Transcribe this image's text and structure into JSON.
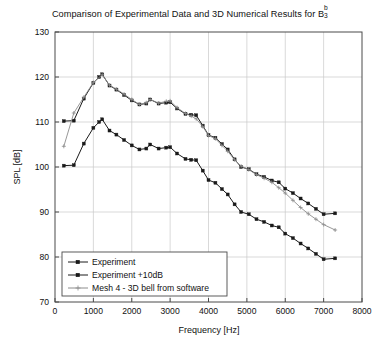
{
  "chart_data": {
    "type": "line",
    "title": "Comparison of Experimental Data and 3D Numerical Results for B",
    "title_superscript": "b",
    "title_subscript": "3",
    "xlabel": "Frequency [Hz]",
    "ylabel": "SPL [dB]",
    "xlim": [
      0,
      8000
    ],
    "ylim": [
      70,
      130
    ],
    "xticks": [
      0,
      1000,
      2000,
      3000,
      4000,
      5000,
      6000,
      7000,
      8000
    ],
    "yticks": [
      70,
      80,
      90,
      100,
      110,
      120,
      130
    ],
    "grid": true,
    "legend_position": "lower left",
    "series": [
      {
        "name": "Experiment",
        "color": "#1a1a1a",
        "marker": "square",
        "x": [
          230,
          490,
          750,
          1000,
          1150,
          1230,
          1420,
          1600,
          1800,
          2000,
          2200,
          2380,
          2480,
          2700,
          2900,
          3000,
          3180,
          3400,
          3550,
          3680,
          3850,
          4000,
          4180,
          4350,
          4500,
          4680,
          4850,
          5050,
          5250,
          5450,
          5650,
          5830,
          6000,
          6200,
          6400,
          6600,
          6800,
          7000,
          7300
        ],
        "y": [
          100.3,
          100.4,
          105.2,
          108.7,
          110.0,
          110.6,
          108.1,
          107.2,
          106.0,
          104.8,
          103.9,
          104.1,
          105.0,
          104.1,
          104.3,
          104.4,
          103.0,
          101.8,
          101.6,
          101.5,
          99.2,
          97.1,
          96.5,
          95.1,
          93.9,
          91.7,
          90.0,
          89.5,
          88.4,
          87.8,
          87.0,
          86.6,
          85.2,
          84.2,
          83.0,
          81.9,
          80.7,
          79.5,
          79.7
        ]
      },
      {
        "name": "Experiment +10dB",
        "color": "#1a1a1a",
        "marker": "square",
        "x": [
          230,
          490,
          750,
          1000,
          1150,
          1230,
          1420,
          1600,
          1800,
          2000,
          2200,
          2380,
          2480,
          2700,
          2900,
          3000,
          3180,
          3400,
          3550,
          3680,
          3850,
          4000,
          4180,
          4350,
          4500,
          4680,
          4850,
          5050,
          5250,
          5450,
          5650,
          5830,
          6000,
          6200,
          6400,
          6600,
          6800,
          7000,
          7300
        ],
        "y": [
          110.2,
          110.3,
          115.2,
          118.7,
          120.0,
          120.6,
          118.1,
          117.2,
          116.0,
          114.8,
          113.9,
          114.1,
          115.0,
          114.1,
          114.3,
          114.4,
          113.0,
          111.8,
          111.6,
          111.5,
          109.2,
          107.1,
          106.5,
          105.1,
          103.9,
          101.7,
          100.0,
          99.5,
          98.4,
          97.8,
          97.0,
          96.6,
          95.2,
          94.2,
          93.0,
          91.9,
          90.7,
          89.5,
          89.7
        ]
      },
      {
        "name": "Mesh 4 - 3D bell from software",
        "color": "#8c8c8c",
        "marker": "plus",
        "x": [
          230,
          490,
          750,
          1000,
          1230,
          1420,
          1600,
          1800,
          2000,
          2200,
          2380,
          2480,
          2700,
          2900,
          3000,
          3180,
          3400,
          3550,
          3680,
          3850,
          4000,
          4180,
          4350,
          4500,
          4680,
          4850,
          5050,
          5250,
          5450,
          5650,
          5830,
          6000,
          6200,
          6400,
          6600,
          6800,
          7000,
          7300
        ],
        "y": [
          104.6,
          112.0,
          115.5,
          118.8,
          120.5,
          118.2,
          117.3,
          116.2,
          115.0,
          113.9,
          114.3,
          115.0,
          114.2,
          114.6,
          114.7,
          113.2,
          111.9,
          111.3,
          110.7,
          109.0,
          107.0,
          106.3,
          104.8,
          103.5,
          101.6,
          100.2,
          99.4,
          98.3,
          97.5,
          96.6,
          95.4,
          94.2,
          92.6,
          91.0,
          89.6,
          88.4,
          87.2,
          86.0
        ]
      }
    ]
  },
  "legend": {
    "items": [
      {
        "label": "Experiment"
      },
      {
        "label": "Experiment +10dB"
      },
      {
        "label": "Mesh 4 - 3D bell from software"
      }
    ]
  }
}
